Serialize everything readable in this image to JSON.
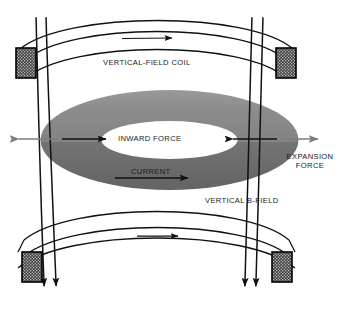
{
  "diagram": {
    "labels": {
      "coil": "VERTICAL-FIELD COIL",
      "inward_force": "INWARD FORCE",
      "expansion_force_line1": "EXPANSION",
      "expansion_force_line2": "FORCE",
      "current": "CURRENT",
      "vertical_b_field": "VERTICAL B-FIELD"
    },
    "icons": {
      "coil_current_arrow_top": "arrow-right-icon",
      "coil_current_arrow_bottom": "arrow-right-icon",
      "inward_force_arrow_left": "arrow-right-icon",
      "inward_force_arrow_right": "arrow-left-icon",
      "expansion_arrow_left": "arrow-left-icon",
      "expansion_arrow_right": "arrow-right-icon",
      "plasma_current_arrow": "arrow-right-icon",
      "b_field_arrow_1": "arrow-down-icon",
      "b_field_arrow_2": "arrow-down-icon",
      "b_field_arrow_3": "arrow-down-icon",
      "b_field_arrow_4": "arrow-down-icon"
    },
    "colors": {
      "background": "#ffffff",
      "stroke": "#111111",
      "text": "#1a1a1a",
      "torus_upper": "#8a8a8a",
      "torus_lower": "#6a6a6a",
      "torus_mid": "#7b7b7b",
      "coil_fill": "#4a4a4a",
      "coil_border": "#000000",
      "expansion_arrow": "#7d7d7d"
    },
    "elements": {
      "coil_cross_sections": 4,
      "b_field_lines": 4,
      "coil_bands": 2,
      "torus": "plasma-ring"
    }
  }
}
